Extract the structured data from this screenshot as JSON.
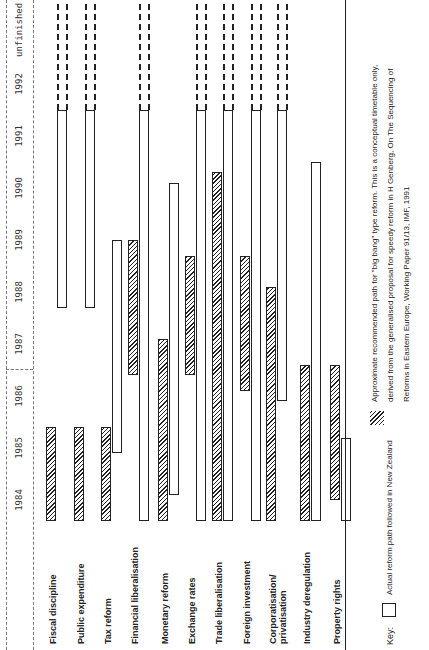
{
  "chart_data": {
    "type": "gantt",
    "title": "",
    "xlabel": "Year",
    "categories": [
      "1984",
      "1985",
      "1986",
      "1987",
      "1988",
      "1989",
      "1990",
      "1991",
      "1992",
      "unfinished"
    ],
    "xlim": [
      1984,
      1993
    ],
    "series": [
      {
        "name": "Actual reform path followed in New Zealand",
        "style": "open"
      },
      {
        "name": "Approximate recommended path for \"big bang\" type reform",
        "style": "hatched"
      }
    ],
    "rows": [
      {
        "label": "Fiscal discipline",
        "recommended": [
          1984.1,
          1985.9
        ],
        "actual": [
          1988.2,
          1993
        ],
        "actual_ongoing": true
      },
      {
        "label": "Public expenditure",
        "recommended": [
          1984.1,
          1985.9
        ],
        "actual": [
          1988.2,
          1993
        ],
        "actual_ongoing": true
      },
      {
        "label": "Tax reform",
        "recommended": [
          1984.1,
          1985.9
        ],
        "actual": [
          1985.4,
          1989.5
        ]
      },
      {
        "label": "Financial liberalisation",
        "recommended": [
          1986.9,
          1989.5
        ],
        "actual": [
          1984.1,
          1993
        ],
        "actual_ongoing": true
      },
      {
        "label": "Monetary reform",
        "recommended": [
          1984.1,
          1987.6
        ],
        "actual": [
          1984.6,
          1990.6
        ]
      },
      {
        "label": "Exchange rates",
        "recommended": [
          1986.9,
          1989.2
        ],
        "actual": [
          1984.1,
          1993
        ],
        "actual_ongoing": true
      },
      {
        "label": "Trade liberalisation",
        "recommended": [
          1984.1,
          1990.8
        ],
        "actual": [
          1984.1,
          1993
        ],
        "actual_ongoing": true
      },
      {
        "label": "Foreign investment",
        "recommended": [
          1986.6,
          1989.2
        ],
        "actual": [
          1984.1,
          1993
        ],
        "actual_ongoing": true
      },
      {
        "label": "Corporatisation/ privatisation",
        "recommended": [
          1984.1,
          1988.6
        ],
        "actual": [
          1986.4,
          1993
        ],
        "actual_ongoing": true
      },
      {
        "label": "Industry deregulation",
        "recommended": [
          1984.1,
          1987.1
        ],
        "actual": [
          1984.1,
          1991.0
        ]
      },
      {
        "label": "Property rights",
        "recommended": [
          1984.5,
          1987.1
        ],
        "actual": [
          1984.1,
          1985.7
        ]
      }
    ]
  },
  "axis": {
    "years": [
      "1984",
      "1985",
      "1986",
      "1987",
      "1988",
      "1989",
      "1990",
      "1991",
      "1992",
      "unfinished"
    ]
  },
  "key": {
    "label": "Key:",
    "actual": "Actual reform path followed in New Zealand",
    "recommended_line1": "Approximate recommended path for \"big bang\" type reform. This is a conceptual timetable only,",
    "recommended_line2": "derived from the generalised proposal for speedy reform in H Genberg, On The Sequencing of",
    "recommended_line3": "Reforms in Eastern Europe, Working Paper 91/13, IMF, 1991"
  },
  "colors": {
    "ink": "#222222",
    "paper": "#ffffff"
  }
}
